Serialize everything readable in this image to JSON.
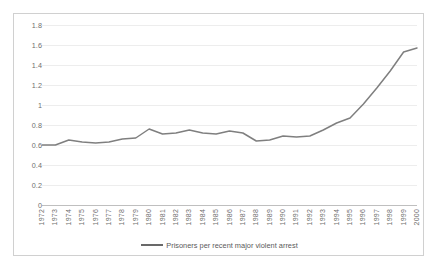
{
  "chart_data": {
    "type": "line",
    "title": "",
    "xlabel": "",
    "ylabel": "",
    "ylim": [
      0,
      1.8
    ],
    "yticks": [
      "0",
      "0.2",
      "0.4",
      "0.6",
      "0.8",
      "1",
      "1.2",
      "1.4",
      "1.6",
      "1.8"
    ],
    "grid": true,
    "legend_position": "bottom",
    "legend": [
      "Prisoners per recent major violent arrest"
    ],
    "line_color": "#7f7f7f",
    "categories": [
      "1972",
      "1973",
      "1974",
      "1975",
      "1976",
      "1977",
      "1978",
      "1979",
      "1980",
      "1981",
      "1982",
      "1983",
      "1984",
      "1985",
      "1986",
      "1987",
      "1988",
      "1989",
      "1990",
      "1991",
      "1992",
      "1993",
      "1994",
      "1995",
      "1996",
      "1997",
      "1998",
      "1999",
      "2000"
    ],
    "series": [
      {
        "name": "Prisoners per recent major violent arrest",
        "values": [
          0.6,
          0.6,
          0.65,
          0.63,
          0.62,
          0.63,
          0.66,
          0.67,
          0.76,
          0.71,
          0.72,
          0.75,
          0.72,
          0.71,
          0.74,
          0.72,
          0.64,
          0.65,
          0.69,
          0.68,
          0.69,
          0.75,
          0.82,
          0.87,
          1.01,
          1.17,
          1.34,
          1.53,
          1.57
        ]
      }
    ]
  },
  "axis": {
    "y_min_label": "0",
    "y_max_label": "1.8"
  }
}
